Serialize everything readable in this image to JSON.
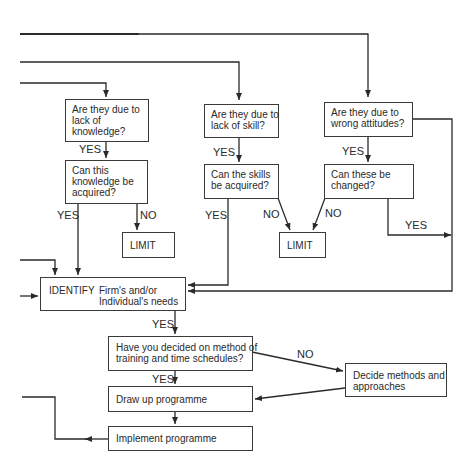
{
  "diagram": {
    "type": "flowchart",
    "nodes": {
      "q_knowledge": {
        "lines": [
          "Are they due to",
          "lack of",
          "knowledge?"
        ]
      },
      "q_skill": {
        "lines": [
          "Are they due to",
          "lack of skill?"
        ]
      },
      "q_attitudes": {
        "lines": [
          "Are they due to",
          "wrong attitudes?"
        ]
      },
      "q_knowledge_acquire": {
        "lines": [
          "Can this",
          "knowledge be",
          "acquired?"
        ]
      },
      "q_skill_acquire": {
        "lines": [
          "Can the skills",
          "be acquired?"
        ]
      },
      "q_attitudes_change": {
        "lines": [
          "Can these be",
          "changed?"
        ]
      },
      "limit_1": {
        "label": "LIMIT"
      },
      "limit_2": {
        "label": "LIMIT"
      },
      "identify": {
        "keyword": "IDENTIFY",
        "lines": [
          "Firm's and/or",
          "Individual's needs"
        ]
      },
      "q_method": {
        "lines": [
          "Have you decided on method of",
          "training and time schedules?"
        ]
      },
      "decide_methods": {
        "lines": [
          "Decide methods and",
          "approaches"
        ]
      },
      "draw_up": {
        "label": "Draw up programme"
      },
      "implement": {
        "label": "Implement programme"
      }
    },
    "edge_labels": {
      "yes_knowledge": "YES",
      "yes_skill": "YES",
      "yes_attitudes": "YES",
      "yes_knowledge_acquire": "YES",
      "no_knowledge_acquire": "NO",
      "yes_skill_acquire": "YES",
      "no_skill_acquire": "NO",
      "no_attitudes_change": "NO",
      "yes_attitudes_change": "YES",
      "yes_identify": "YES",
      "no_method": "NO",
      "yes_method": "YES"
    },
    "colors": {
      "line": "#2a2a2a",
      "text": "#2a2a2a",
      "background": "#ffffff"
    }
  }
}
